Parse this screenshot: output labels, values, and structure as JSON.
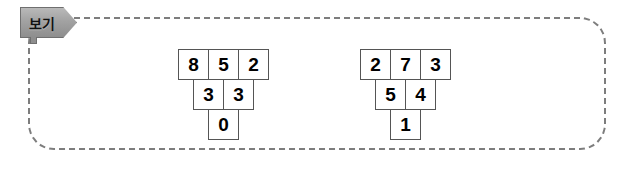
{
  "example_box": {
    "tag_label": "보기",
    "border_color": "#7d7d7d",
    "tag_color": "#a2a2a2"
  },
  "pyramids": [
    {
      "name": "left",
      "rows": [
        [
          "8",
          "5",
          "2"
        ],
        [
          "3",
          "3"
        ],
        [
          "0"
        ]
      ]
    },
    {
      "name": "right",
      "rows": [
        [
          "2",
          "7",
          "3"
        ],
        [
          "5",
          "4"
        ],
        [
          "1"
        ]
      ]
    }
  ]
}
